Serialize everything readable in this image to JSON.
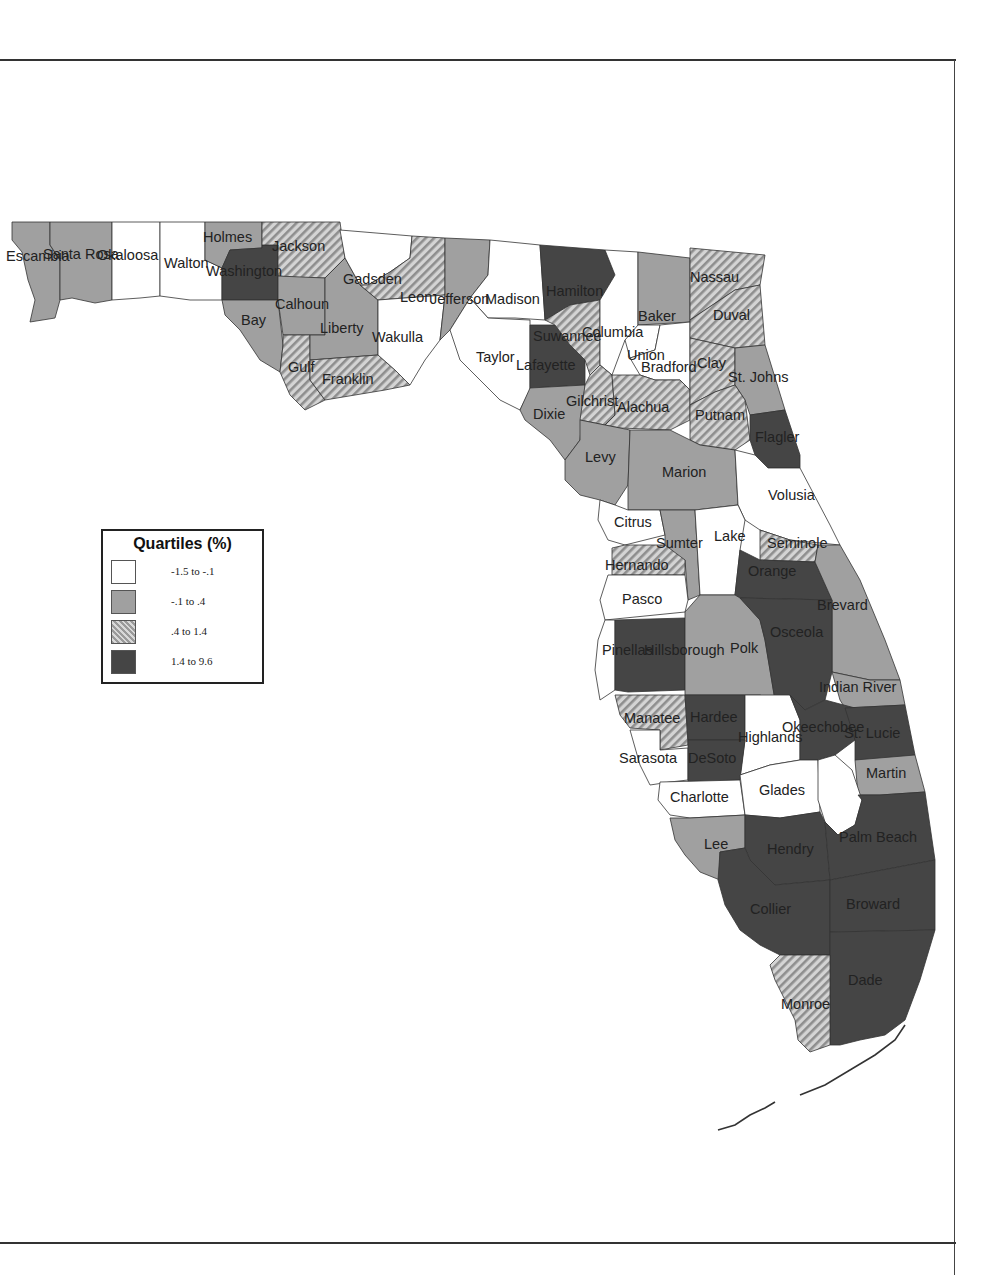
{
  "legend": {
    "title": "Quartiles (%)",
    "classes": [
      {
        "id": "q1",
        "label": "-1.5 to -.1",
        "fill": "#ffffff"
      },
      {
        "id": "q2",
        "label": "-.1 to .4",
        "fill": "#a0a0a0"
      },
      {
        "id": "q3",
        "label": ".4 to 1.4",
        "fill": "hatched"
      },
      {
        "id": "q4",
        "label": "1.4 to 9.6",
        "fill": "#454545"
      }
    ]
  },
  "counties": {
    "escambia": {
      "name": "Escambia",
      "class": "q2"
    },
    "santa_rosa": {
      "name": "Santa Rosa",
      "class": "q2"
    },
    "okaloosa": {
      "name": "Okaloosa",
      "class": "q1"
    },
    "walton": {
      "name": "Walton",
      "class": "q1"
    },
    "holmes": {
      "name": "Holmes",
      "class": "q2"
    },
    "washington": {
      "name": "Washington",
      "class": "q4"
    },
    "jackson": {
      "name": "Jackson",
      "class": "q3"
    },
    "bay": {
      "name": "Bay",
      "class": "q2"
    },
    "calhoun": {
      "name": "Calhoun",
      "class": "q2"
    },
    "gulf": {
      "name": "Gulf",
      "class": "q3"
    },
    "liberty": {
      "name": "Liberty",
      "class": "q2"
    },
    "franklin": {
      "name": "Franklin",
      "class": "q3"
    },
    "gadsden": {
      "name": "Gadsden",
      "class": "q1"
    },
    "leon": {
      "name": "Leon",
      "class": "q3"
    },
    "wakulla": {
      "name": "Wakulla",
      "class": "q1"
    },
    "jefferson": {
      "name": "Jefferson",
      "class": "q2"
    },
    "madison": {
      "name": "Madison",
      "class": "q1"
    },
    "taylor": {
      "name": "Taylor",
      "class": "q1"
    },
    "hamilton": {
      "name": "Hamilton",
      "class": "q4"
    },
    "suwannee": {
      "name": "Suwannee",
      "class": "q3"
    },
    "lafayette": {
      "name": "Lafayette",
      "class": "q4"
    },
    "columbia": {
      "name": "Columbia",
      "class": "q1"
    },
    "dixie": {
      "name": "Dixie",
      "class": "q2"
    },
    "gilchrist": {
      "name": "Gilchrist",
      "class": "q3"
    },
    "baker": {
      "name": "Baker",
      "class": "q2"
    },
    "union": {
      "name": "Union",
      "class": "q1"
    },
    "bradford": {
      "name": "Bradford",
      "class": "q1"
    },
    "alachua": {
      "name": "Alachua",
      "class": "q3"
    },
    "nassau": {
      "name": "Nassau",
      "class": "q3"
    },
    "duval": {
      "name": "Duval",
      "class": "q3"
    },
    "clay": {
      "name": "Clay",
      "class": "q3"
    },
    "st_johns": {
      "name": "St. Johns",
      "class": "q2"
    },
    "putnam": {
      "name": "Putnam",
      "class": "q3"
    },
    "flagler": {
      "name": "Flagler",
      "class": "q4"
    },
    "levy": {
      "name": "Levy",
      "class": "q2"
    },
    "marion": {
      "name": "Marion",
      "class": "q2"
    },
    "volusia": {
      "name": "Volusia",
      "class": "q1"
    },
    "citrus": {
      "name": "Citrus",
      "class": "q1"
    },
    "sumter": {
      "name": "Sumter",
      "class": "q2"
    },
    "lake": {
      "name": "Lake",
      "class": "q1"
    },
    "seminole": {
      "name": "Seminole",
      "class": "q3"
    },
    "hernando": {
      "name": "Hernando",
      "class": "q3"
    },
    "orange": {
      "name": "Orange",
      "class": "q4"
    },
    "pasco": {
      "name": "Pasco",
      "class": "q1"
    },
    "brevard": {
      "name": "Brevard",
      "class": "q2"
    },
    "pinellas": {
      "name": "Pinellas",
      "class": "q1"
    },
    "hillsborough": {
      "name": "Hillsborough",
      "class": "q4"
    },
    "polk": {
      "name": "Polk",
      "class": "q2"
    },
    "osceola": {
      "name": "Osceola",
      "class": "q4"
    },
    "indian_river": {
      "name": "Indian River",
      "class": "q2"
    },
    "manatee": {
      "name": "Manatee",
      "class": "q3"
    },
    "hardee": {
      "name": "Hardee",
      "class": "q4"
    },
    "highlands": {
      "name": "Highlands",
      "class": "q1"
    },
    "okeechobee": {
      "name": "Okeechobee",
      "class": "q4"
    },
    "st_lucie": {
      "name": "St. Lucie",
      "class": "q4"
    },
    "sarasota": {
      "name": "Sarasota",
      "class": "q1"
    },
    "desoto": {
      "name": "DeSoto",
      "class": "q4"
    },
    "martin": {
      "name": "Martin",
      "class": "q2"
    },
    "charlotte": {
      "name": "Charlotte",
      "class": "q1"
    },
    "glades": {
      "name": "Glades",
      "class": "q1"
    },
    "lee": {
      "name": "Lee",
      "class": "q2"
    },
    "hendry": {
      "name": "Hendry",
      "class": "q4"
    },
    "palm_beach": {
      "name": "Palm Beach",
      "class": "q4"
    },
    "collier": {
      "name": "Collier",
      "class": "q4"
    },
    "broward": {
      "name": "Broward",
      "class": "q4"
    },
    "dade": {
      "name": "Dade",
      "class": "q4"
    },
    "monroe": {
      "name": "Monroe",
      "class": "q3"
    }
  }
}
